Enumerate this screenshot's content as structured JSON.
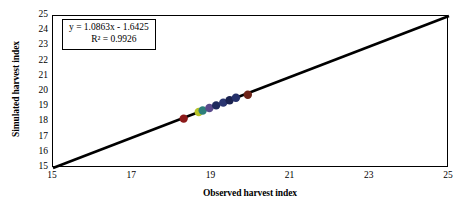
{
  "chart_data": {
    "type": "scatter",
    "title": "",
    "xlabel": "Observed harvest index",
    "ylabel": "Simulated harvest index",
    "xlim": [
      15,
      25
    ],
    "ylim": [
      15,
      25
    ],
    "xticks": [
      15,
      17,
      19,
      21,
      23,
      25
    ],
    "yticks": [
      15,
      16,
      17,
      18,
      19,
      20,
      21,
      22,
      23,
      24,
      25
    ],
    "grid": false,
    "legend": null,
    "annotations": {
      "equation": "y = 1.0863x - 1.6425",
      "r_squared": "R² = 0.9926"
    },
    "fit_line": {
      "slope": 1.0863,
      "intercept": -1.6425,
      "color": "#000000",
      "x_start": 15,
      "x_end": 25,
      "y_start": 15,
      "y_end": 25
    },
    "points": [
      {
        "x": 18.3,
        "y": 18.25,
        "color": "#8c1a1a"
      },
      {
        "x": 18.68,
        "y": 18.68,
        "color": "#b8c428"
      },
      {
        "x": 18.78,
        "y": 18.78,
        "color": "#2e7f7a"
      },
      {
        "x": 18.95,
        "y": 18.95,
        "color": "#5a4a8c"
      },
      {
        "x": 19.12,
        "y": 19.12,
        "color": "#1e2a5e"
      },
      {
        "x": 19.3,
        "y": 19.3,
        "color": "#2a3570"
      },
      {
        "x": 19.46,
        "y": 19.46,
        "color": "#1a2250"
      },
      {
        "x": 19.62,
        "y": 19.62,
        "color": "#24306a"
      },
      {
        "x": 19.92,
        "y": 19.82,
        "color": "#6e2418"
      }
    ]
  },
  "axis": {
    "y_tick_labels": [
      "25",
      "24",
      "23",
      "22",
      "21",
      "20",
      "19",
      "18",
      "17",
      "16",
      "15"
    ],
    "x_tick_labels": [
      "15",
      "17",
      "19",
      "21",
      "23",
      "25"
    ]
  }
}
